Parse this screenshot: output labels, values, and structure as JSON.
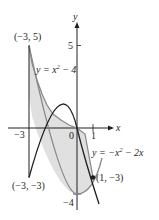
{
  "diagram": {
    "axes": {
      "x_label": "x",
      "y_label": "y"
    },
    "ticks": {
      "x_neg3": "−3",
      "x_0": "0",
      "x_1": "1",
      "y_5": "5",
      "y_neg4": "−4"
    },
    "curves": [
      {
        "label_prefix": "y = x",
        "label_exp": "2",
        "label_suffix": " − 4",
        "equation": "y = x^2 - 4"
      },
      {
        "label_prefix": "y = −x",
        "label_exp": "2",
        "label_suffix": " − 2x",
        "equation": "y = -x^2 - 2x"
      }
    ],
    "points": [
      {
        "label": "(−3, 5)",
        "x": -3,
        "y": 5
      },
      {
        "label": "(−3, −3)",
        "x": -3,
        "y": -3
      },
      {
        "label": "(1, −3)",
        "x": 1,
        "y": -3
      }
    ],
    "colors": {
      "shade": "#e0e0e0",
      "curve": "#231f20",
      "curve2": "#8a8a8a"
    }
  }
}
